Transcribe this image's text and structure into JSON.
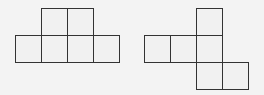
{
  "diagram": {
    "title": "",
    "figures": [
      {
        "name": "net-left",
        "squares": [
          [
            41,
            8
          ],
          [
            67,
            8
          ],
          [
            15,
            35
          ],
          [
            41,
            35
          ],
          [
            67,
            35
          ],
          [
            93,
            35
          ]
        ]
      },
      {
        "name": "net-right",
        "squares": [
          [
            196,
            8
          ],
          [
            144,
            35
          ],
          [
            170,
            35
          ],
          [
            196,
            35
          ],
          [
            196,
            62
          ],
          [
            222,
            62
          ]
        ]
      }
    ],
    "line_color": "#333333",
    "background": "#f3f3f3"
  }
}
